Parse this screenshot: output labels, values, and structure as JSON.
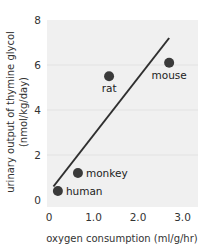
{
  "chart_data": {
    "type": "scatter",
    "title": "",
    "xlabel": "oxygen consumption (ml/g/hr)",
    "ylabel": "urinary output of thymine glycol",
    "ylabel_units": "(nmol/kg/day)",
    "xlim": [
      0,
      3.0
    ],
    "ylim": [
      0,
      8
    ],
    "x_ticks": [
      "0",
      "1.0",
      "2.0",
      "3.0"
    ],
    "y_ticks": [
      "0",
      "2",
      "4",
      "6",
      "8"
    ],
    "grid": "horizontal faint",
    "legend": "none",
    "points": [
      {
        "label": "human",
        "x": 0.2,
        "y": 0.4
      },
      {
        "label": "monkey",
        "x": 0.65,
        "y": 1.2
      },
      {
        "label": "rat",
        "x": 1.35,
        "y": 5.5
      },
      {
        "label": "mouse",
        "x": 2.7,
        "y": 6.1
      }
    ],
    "trendline": {
      "x0": 0.1,
      "y0": 0.6,
      "x1": 2.7,
      "y1": 7.2
    },
    "colors": {
      "plot_bg": "#f0f0f0",
      "points": "#3a3a3a",
      "line": "#2f2f2f"
    }
  }
}
